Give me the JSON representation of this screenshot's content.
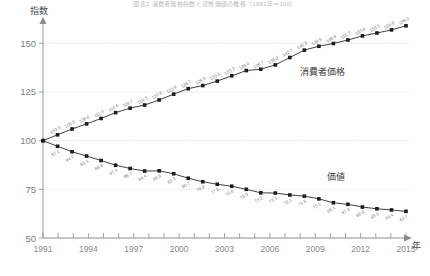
{
  "chart_data": {
    "type": "line",
    "title": "図表1 消費者価格指数と貨幣価値の推移（1991年＝100）",
    "xlabel": "年",
    "ylabel": "指数",
    "ylim": [
      50,
      163
    ],
    "xlim": [
      1991,
      2015
    ],
    "yticks": [
      50,
      75,
      100,
      125,
      150
    ],
    "xticks_labeled": [
      1991,
      1994,
      1997,
      2000,
      2003,
      2006,
      2009,
      2012,
      2015
    ],
    "grid": true,
    "legend_position": "inline-annotation",
    "x": [
      1991,
      1992,
      1993,
      1994,
      1995,
      1996,
      1997,
      1998,
      1999,
      2000,
      2001,
      2002,
      2003,
      2004,
      2005,
      2006,
      2007,
      2008,
      2009,
      2010,
      2011,
      2012,
      2013,
      2014,
      2015
    ],
    "series": [
      {
        "name": "消費者価格",
        "values": [
          100.0,
          103.0,
          106.0,
          108.6,
          111.4,
          114.4,
          116.7,
          118.3,
          120.9,
          123.9,
          126.7,
          128.3,
          130.6,
          133.3,
          136.0,
          136.7,
          138.9,
          142.7,
          146.5,
          148.5,
          149.9,
          151.7,
          153.8,
          155.3,
          156.9
        ],
        "point_labels": [
          "",
          "103.0",
          "106.0",
          "108.6",
          "111.4",
          "114.4",
          "116.7",
          "118.3",
          "120.9",
          "123.9",
          "126.7",
          "128.3",
          "130.6",
          "133.3",
          "136.0",
          "136.7",
          "138.9",
          "142.7",
          "146.5",
          "148.5",
          "149.9",
          "151.7",
          "153.8",
          "155.3",
          "156.9"
        ],
        "end_label": "159.0"
      },
      {
        "name": "価値",
        "values": [
          100.0,
          97.1,
          94.3,
          92.1,
          89.8,
          87.4,
          85.7,
          84.4,
          84.5,
          83.0,
          80.7,
          78.9,
          77.6,
          76.6,
          75.0,
          73.2,
          73.1,
          72.1,
          71.5,
          70.1,
          68.1,
          67.3,
          65.9,
          65.0,
          64.4
        ],
        "point_labels": [
          "",
          "97.1",
          "94.3",
          "92.1",
          "89.8",
          "87.4",
          "85.7",
          "84.4",
          "84.5",
          "83.0",
          "80.7",
          "78.9",
          "77.6",
          "76.6",
          "75.0",
          "73.2",
          "73.1",
          "72.1",
          "71.5",
          "70.1",
          "68.1",
          "67.3",
          "65.9",
          "65.0",
          "64.4"
        ],
        "end_label": "63.7"
      }
    ],
    "annotations": [
      {
        "text": "消費者価格",
        "series": "upper"
      },
      {
        "text": "価値",
        "series": "lower"
      }
    ]
  }
}
